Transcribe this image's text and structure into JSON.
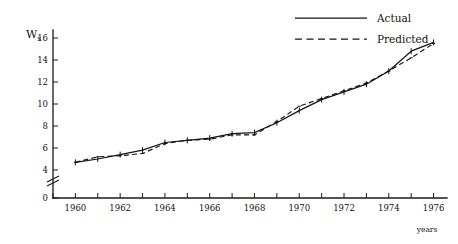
{
  "chart_data": {
    "type": "line",
    "title": "",
    "subtitle": "",
    "xlabel": "years",
    "ylabel": "Ws",
    "ylabel_base": "W",
    "ylabel_subscript": "s",
    "grid": false,
    "legend_position": "top-right",
    "axis_break": true,
    "axis_break_between": [
      0,
      4
    ],
    "xlim": [
      1959,
      1976.6
    ],
    "ylim": [
      0,
      17
    ],
    "ytick_labels": [
      "0",
      "4",
      "6",
      "8",
      "10",
      "12",
      "14",
      "16"
    ],
    "ytick_values": [
      0,
      4,
      6,
      8,
      10,
      12,
      14,
      16
    ],
    "xtick_labels": [
      "1960",
      "1962",
      "1964",
      "1966",
      "1968",
      "1970",
      "1972",
      "1974",
      "1976"
    ],
    "xtick_values": [
      1960,
      1962,
      1964,
      1966,
      1968,
      1970,
      1972,
      1974,
      1976
    ],
    "xminor_values": [
      1959,
      1960,
      1961,
      1962,
      1963,
      1964,
      1965,
      1966,
      1967,
      1968,
      1969,
      1970,
      1971,
      1972,
      1973,
      1974,
      1975,
      1976
    ],
    "x": [
      1960,
      1961,
      1962,
      1963,
      1964,
      1965,
      1966,
      1967,
      1968,
      1969,
      1970,
      1971,
      1972,
      1973,
      1974,
      1975,
      1976
    ],
    "series": [
      {
        "name": "Actual",
        "style": "solid",
        "color": "#141414",
        "values": [
          4.7,
          5.0,
          5.4,
          5.8,
          6.5,
          6.7,
          6.9,
          7.3,
          7.4,
          8.3,
          9.4,
          10.4,
          11.1,
          11.8,
          13.0,
          14.8,
          15.6
        ]
      },
      {
        "name": "Predicted",
        "style": "dashed",
        "color": "#141414",
        "values": [
          4.7,
          5.2,
          5.3,
          5.5,
          6.4,
          6.7,
          6.8,
          7.2,
          7.2,
          8.4,
          9.8,
          10.5,
          11.2,
          11.9,
          13.0,
          14.2,
          15.5
        ]
      }
    ]
  },
  "legend": {
    "items": [
      {
        "label": "Actual",
        "style": "solid"
      },
      {
        "label": "Predicted",
        "style": "dashed"
      }
    ]
  },
  "axes": {
    "y_axis_name": "Ws",
    "x_axis_name": "years"
  }
}
